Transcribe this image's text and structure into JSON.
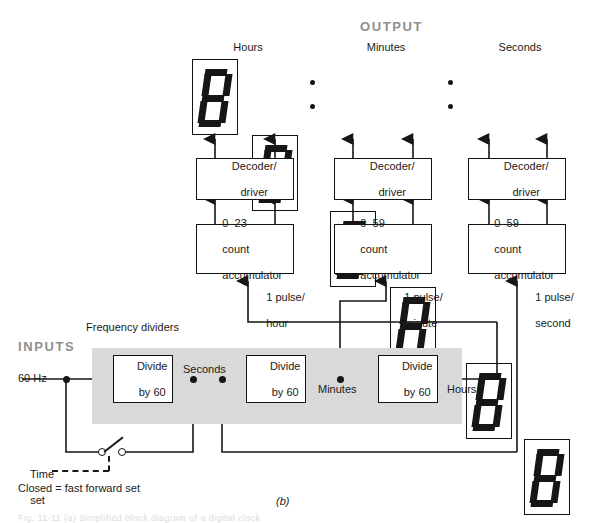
{
  "figure": {
    "sub_label": "(b)",
    "bottom_caption_cut": "Fig. 11-11   (a) Simplified block diagram of a digital clock"
  },
  "sections": {
    "output_heading": "OUTPUT",
    "inputs_heading": "INPUTS",
    "frequency_dividers_label": "Frequency dividers"
  },
  "display": {
    "group_labels": [
      "Hours",
      "Minutes",
      "Seconds"
    ],
    "digit_value": "8",
    "separator": ":",
    "digit_count": 6
  },
  "decoders": [
    {
      "line1": "Decoder/",
      "line2": "driver"
    },
    {
      "line1": "Decoder/",
      "line2": "driver"
    },
    {
      "line1": "Decoder/",
      "line2": "driver"
    }
  ],
  "accumulators": [
    {
      "range": "0–23",
      "line2": "count",
      "line3": "accumulator"
    },
    {
      "range": "0–59",
      "line2": "count",
      "line3": "accumulator"
    },
    {
      "range": "0–59",
      "line2": "count",
      "line3": "accumulator"
    }
  ],
  "pulse_labels": [
    {
      "line1": "1 pulse/",
      "line2": "hour"
    },
    {
      "line1": "1 pulse/",
      "line2": "minute"
    },
    {
      "line1": "1 pulse/",
      "line2": "second"
    }
  ],
  "dividers": [
    {
      "line1": "Divide",
      "line2": "by 60"
    },
    {
      "line1": "Divide",
      "line2": "by 60"
    },
    {
      "line1": "Divide",
      "line2": "by 60"
    }
  ],
  "signals": {
    "input_freq": "60 Hz",
    "seconds": "Seconds",
    "minutes": "Minutes",
    "hours": "Hours"
  },
  "time_set": {
    "line1": "Time",
    "line2": "set",
    "note": "Closed = fast forward set"
  },
  "colors": {
    "ink": "#161616",
    "heading_gray": "#8f8f8f",
    "band_gray": "#d9d9d9",
    "page": "#ffffff"
  }
}
